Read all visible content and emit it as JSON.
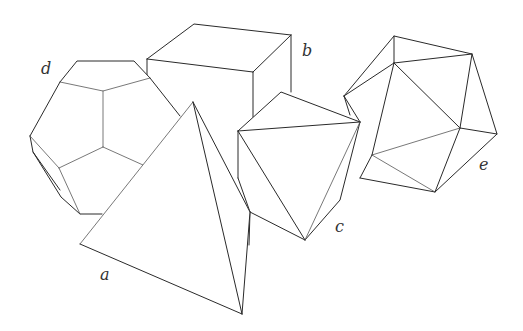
{
  "solids": [
    {
      "id": "a",
      "name": "tetrahedron",
      "label": "a"
    },
    {
      "id": "b",
      "name": "cube",
      "label": "b"
    },
    {
      "id": "c",
      "name": "octahedron",
      "label": "c"
    },
    {
      "id": "d",
      "name": "dodecahedron",
      "label": "d"
    },
    {
      "id": "e",
      "name": "icosahedron",
      "label": "e"
    }
  ],
  "colors": {
    "background": "#ffffff",
    "ink": "#2a2a2a"
  }
}
